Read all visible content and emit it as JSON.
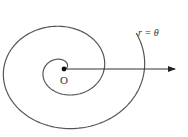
{
  "diagram": {
    "curve_label": "r = θ",
    "origin_label": "O",
    "colors": {
      "curve": "#555555",
      "axis": "#333333",
      "background": "#ffffff"
    }
  },
  "chart_data": {
    "type": "polar-curve",
    "equation": "r = θ",
    "origin_px": [
      64,
      69
    ],
    "theta_range": [
      0,
      13.1
    ],
    "scale_px_per_rad": [
      6.4,
      5.4
    ],
    "polar_axis": {
      "from_px": [
        64,
        69
      ],
      "to_px": [
        175,
        69
      ],
      "arrow": true
    },
    "annotations": [
      {
        "text": "r = θ",
        "near": "outer end of spiral, upper right"
      },
      {
        "text": "O",
        "near": "pole (origin)"
      }
    ]
  }
}
